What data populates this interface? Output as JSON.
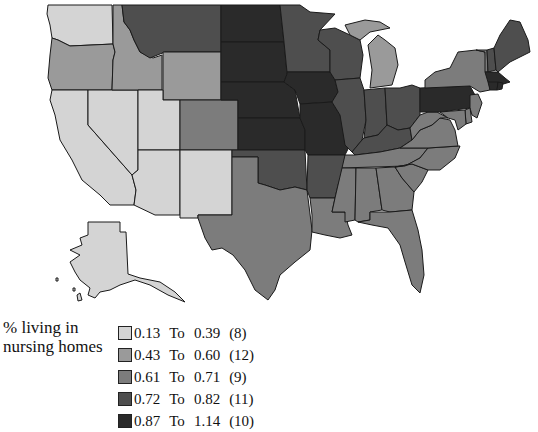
{
  "map": {
    "title": "% living in nursing homes",
    "legend": {
      "title_line1": "% living in",
      "title_line2": "nursing homes",
      "classes": [
        {
          "low": "0.13",
          "to": "To",
          "high": "0.39",
          "count": "(8)",
          "color": "#d4d4d4"
        },
        {
          "low": "0.43",
          "to": "To",
          "high": "0.60",
          "count": "(12)",
          "color": "#9a9a9a"
        },
        {
          "low": "0.61",
          "to": "To",
          "high": "0.71",
          "count": "(9)",
          "color": "#7c7c7c"
        },
        {
          "low": "0.72",
          "to": "To",
          "high": "0.82",
          "count": "(11)",
          "color": "#4e4e4e"
        },
        {
          "low": "0.87",
          "to": "To",
          "high": "1.14",
          "count": "(10)",
          "color": "#2a2a2a"
        }
      ]
    },
    "states": {
      "WA": 0,
      "OR": 1,
      "CA": 0,
      "NV": 0,
      "ID": 1,
      "MT": 3,
      "WY": 1,
      "UT": 0,
      "CO": 2,
      "AZ": 0,
      "NM": 0,
      "ND": 4,
      "SD": 4,
      "NE": 4,
      "KS": 4,
      "OK": 3,
      "TX": 2,
      "MN": 3,
      "IA": 4,
      "MO": 4,
      "AR": 3,
      "LA": 2,
      "WI": 3,
      "IL": 3,
      "MI": 1,
      "IN": 3,
      "OH": 3,
      "KY": 3,
      "TN": 2,
      "MS": 2,
      "AL": 2,
      "GA": 2,
      "FL": 2,
      "SC": 2,
      "NC": 2,
      "VA": 2,
      "WV": 2,
      "PA": 4,
      "NY": 2,
      "VT": 2,
      "NH": 3,
      "ME": 3,
      "MA": 4,
      "CT": 4,
      "RI": 4,
      "NJ": 2,
      "DE": 2,
      "MD": 2,
      "AK": 0,
      "HI": 0
    }
  }
}
